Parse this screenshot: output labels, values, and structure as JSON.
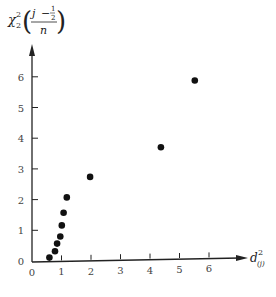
{
  "chart_data": {
    "type": "scatter",
    "title": "",
    "xlabel": "d²_(j)",
    "ylabel": "χ²_2((j − ½)/n)",
    "xlim": [
      0,
      7
    ],
    "ylim": [
      0,
      7
    ],
    "grid": false,
    "legend": null,
    "x_ticks": [
      0,
      1,
      2,
      3,
      4,
      5,
      6
    ],
    "y_ticks": [
      0,
      1,
      2,
      3,
      4,
      5,
      6
    ],
    "points": [
      {
        "x": 0.59,
        "y": 0.1
      },
      {
        "x": 0.78,
        "y": 0.3
      },
      {
        "x": 0.85,
        "y": 0.55
      },
      {
        "x": 0.96,
        "y": 0.78
      },
      {
        "x": 1.01,
        "y": 1.14
      },
      {
        "x": 1.07,
        "y": 1.55
      },
      {
        "x": 1.18,
        "y": 2.05
      },
      {
        "x": 1.97,
        "y": 2.7
      },
      {
        "x": 4.37,
        "y": 3.62
      },
      {
        "x": 5.52,
        "y": 5.77
      }
    ],
    "marker_color": "#111111"
  },
  "labels": {
    "y_axis": {
      "chi": "χ",
      "sup": "2",
      "sub": "2",
      "num_j": "j",
      "minus": "−",
      "half_num": "1",
      "half_den": "2",
      "den_n": "n"
    },
    "x_axis": {
      "d": "d",
      "sup": "2",
      "sub": "(j)"
    },
    "origin": "0"
  }
}
